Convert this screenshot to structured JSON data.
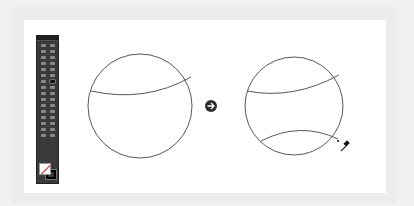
{
  "toolbar": {
    "tool_count": 32,
    "active_tool_index": 13,
    "fill_color": "#ffffff",
    "stroke_color": "#000000"
  },
  "artwork": {
    "before": {
      "cx": 140,
      "cy": 106,
      "r": 52,
      "curves": 1
    },
    "arrow": {
      "icon": "arrow-right-circle-icon",
      "color": "#2b2b2b"
    },
    "after": {
      "cx": 294,
      "cy": 106,
      "r": 50,
      "curves": 2
    },
    "cursor": {
      "icon": "eyedropper-icon"
    }
  },
  "colors": {
    "background": "#f1f1f1",
    "canvas": "#ffffff",
    "stroke": "#444444"
  }
}
